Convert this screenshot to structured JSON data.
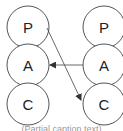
{
  "diagram": {
    "left_column": [
      {
        "id": "left-P",
        "label": "P"
      },
      {
        "id": "left-A",
        "label": "A"
      },
      {
        "id": "left-C",
        "label": "C"
      }
    ],
    "right_column": [
      {
        "id": "right-P",
        "label": "P"
      },
      {
        "id": "right-A",
        "label": "A"
      },
      {
        "id": "right-C",
        "label": "C"
      }
    ],
    "edges": [
      {
        "from": "right-A",
        "to": "left-A"
      },
      {
        "from": "left-P",
        "to": "right-C"
      }
    ],
    "colors": {
      "stroke": "#555555",
      "text": "#222222"
    }
  },
  "caption": "(Partial caption text)"
}
